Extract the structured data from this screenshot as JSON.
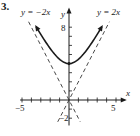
{
  "problem": {
    "number": "3."
  },
  "chart_data": {
    "type": "line",
    "title": "",
    "xlabel": "x",
    "ylabel": "y",
    "xlim": [
      -5.2,
      5.4
    ],
    "ylim": [
      -2.8,
      9.5
    ],
    "x_ticks": [
      -5,
      -4,
      -3,
      -2,
      -1,
      1,
      2,
      3,
      4,
      5
    ],
    "x_tick_labels": {
      "-5": "-5",
      "5": "5"
    },
    "y_ticks": [
      -2,
      -1,
      1,
      2,
      3,
      4,
      5,
      6,
      7,
      8
    ],
    "y_tick_labels": {
      "8": "8",
      "-2": "-2"
    },
    "grid": false,
    "series": [
      {
        "name": "curve",
        "style": "solid",
        "formula": "y = sqrt(4x^2 + 16)",
        "vertex": [
          0,
          4
        ],
        "x": [
          -3.5,
          -3,
          -2,
          -1,
          0,
          1,
          2,
          3,
          3.5
        ],
        "values": [
          8.06,
          7.21,
          5.66,
          4.47,
          4,
          4.47,
          5.66,
          7.21,
          8.06
        ],
        "arrows": "both ends"
      },
      {
        "name": "y = -2x",
        "style": "dashed",
        "label": "y = −2x",
        "x": [
          -4.3,
          1.2
        ],
        "values": [
          8.6,
          -2.4
        ]
      },
      {
        "name": "y = 2x",
        "style": "dashed",
        "label": "y = 2x",
        "x": [
          -1.2,
          4.3
        ],
        "values": [
          -2.4,
          8.6
        ]
      }
    ],
    "annotations": [
      "y = −2x",
      "y = 2x"
    ]
  },
  "labels": {
    "x_axis": "x",
    "y_axis": "y",
    "tick_neg5": "−5",
    "tick_5": "5",
    "tick_8": "8",
    "tick_neg2": "−2",
    "asym_left": "y = −2x",
    "asym_right": "y = 2x"
  },
  "colors": {
    "ink": "#1a1a1a",
    "dashed": "#333333"
  }
}
